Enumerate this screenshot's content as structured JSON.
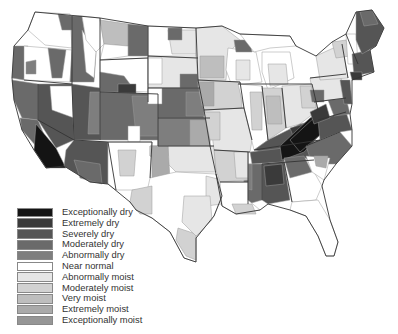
{
  "map": {
    "subject": "United States climate division moisture conditions",
    "stroke_state": "#333333",
    "stroke_division": "#9a9a9a"
  },
  "legend": {
    "items": [
      {
        "label": "Exceptionally dry",
        "color": "#141414"
      },
      {
        "label": "Extremely dry",
        "color": "#3a3a3a"
      },
      {
        "label": "Severely dry",
        "color": "#555555"
      },
      {
        "label": "Moderately dry",
        "color": "#6a6a6a"
      },
      {
        "label": "Abnormally dry",
        "color": "#7e7e7e"
      },
      {
        "label": "Near normal",
        "color": "#ffffff"
      },
      {
        "label": "Abnormally moist",
        "color": "#e6e6e6"
      },
      {
        "label": "Moderately moist",
        "color": "#d2d2d2"
      },
      {
        "label": "Very moist",
        "color": "#bebebe"
      },
      {
        "label": "Extremely moist",
        "color": "#aaaaaa"
      },
      {
        "label": "Exceptionally moist",
        "color": "#969696"
      }
    ]
  }
}
